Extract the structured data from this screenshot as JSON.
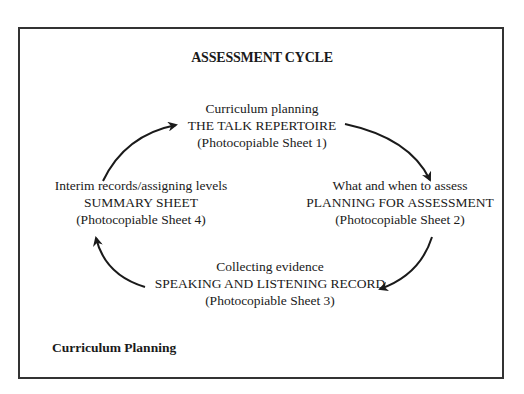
{
  "title": "ASSESSMENT CYCLE",
  "nodes": {
    "top": {
      "caption": "Curriculum planning",
      "name": "THE TALK REPERTOIRE",
      "sheet": "(Photocopiable Sheet 1)"
    },
    "right": {
      "caption": "What and when to assess",
      "name": "PLANNING FOR ASSESSMENT",
      "sheet": "(Photocopiable Sheet 2)"
    },
    "bottom": {
      "caption": "Collecting evidence",
      "name": "SPEAKING AND LISTENING RECORD",
      "sheet": "(Photocopiable Sheet 3)"
    },
    "left": {
      "caption": "Interim records/assigning levels",
      "name": "SUMMARY SHEET",
      "sheet": "(Photocopiable Sheet 4)"
    }
  },
  "footer": "Curriculum Planning",
  "colors": {
    "border": "#333333",
    "text": "#1a1a1a",
    "arrow": "#1a1a1a"
  }
}
